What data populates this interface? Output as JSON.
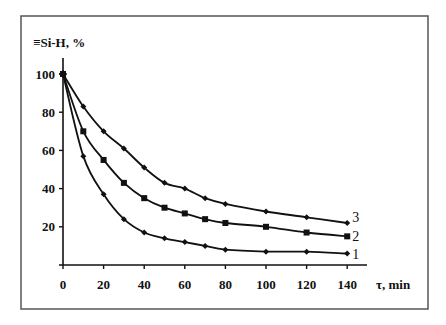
{
  "chart_data": {
    "type": "line",
    "title": "",
    "xlabel": "τ, min",
    "ylabel": "≡Si-H, %",
    "xlim": [
      0,
      140
    ],
    "ylim": [
      0,
      100
    ],
    "grid": false,
    "legend_position": "inline labels at right end of curves",
    "x_ticks": [
      0,
      20,
      40,
      60,
      80,
      100,
      120,
      140
    ],
    "y_ticks": [
      20,
      40,
      60,
      80,
      100
    ],
    "series": [
      {
        "name": "1",
        "marker": "diamond",
        "x": [
          0,
          10,
          20,
          30,
          40,
          50,
          60,
          70,
          80,
          100,
          120,
          140
        ],
        "values": [
          100,
          57,
          37,
          24,
          17,
          14,
          12,
          10,
          8,
          7,
          7,
          6
        ]
      },
      {
        "name": "2",
        "marker": "square",
        "x": [
          0,
          10,
          20,
          30,
          40,
          50,
          60,
          70,
          80,
          100,
          120,
          140
        ],
        "values": [
          100,
          70,
          55,
          43,
          35,
          30,
          27,
          24,
          22,
          20,
          17,
          15
        ]
      },
      {
        "name": "3",
        "marker": "diamond",
        "x": [
          0,
          10,
          20,
          30,
          40,
          50,
          60,
          70,
          80,
          100,
          120,
          140
        ],
        "values": [
          100,
          83,
          70,
          61,
          51,
          43,
          40,
          35,
          32,
          28,
          25,
          22
        ]
      }
    ]
  },
  "colors": {
    "line": "#111111",
    "frame": "#555555",
    "background": "#ffffff"
  }
}
